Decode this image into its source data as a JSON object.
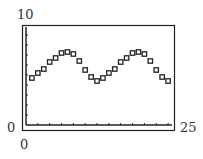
{
  "chart_data": {
    "type": "scatter",
    "title": "",
    "xlabel": "",
    "ylabel": "",
    "xlim": [
      0,
      25
    ],
    "ylim": [
      0,
      10
    ],
    "grid": false,
    "legend": null,
    "marker": "hollow-square",
    "x_tick_step": 2,
    "y_tick_step": 1,
    "x": [
      1,
      2,
      3,
      4,
      5,
      6,
      7,
      8,
      9,
      10,
      11,
      12,
      13,
      14,
      15,
      16,
      17,
      18,
      19,
      20,
      21,
      22,
      23,
      24
    ],
    "y": [
      4.7,
      5.2,
      5.6,
      6.3,
      6.7,
      7.2,
      7.3,
      7.1,
      6.4,
      5.5,
      4.8,
      4.4,
      4.7,
      5.2,
      5.6,
      6.3,
      6.7,
      7.2,
      7.3,
      7.1,
      6.4,
      5.5,
      4.8,
      4.4
    ]
  },
  "labels": {
    "y_max": "10",
    "y_min": "0",
    "x_min": "0",
    "x_max": "25"
  },
  "colors": {
    "axis": "#222222",
    "marker": "#222222",
    "text": "#333333"
  }
}
